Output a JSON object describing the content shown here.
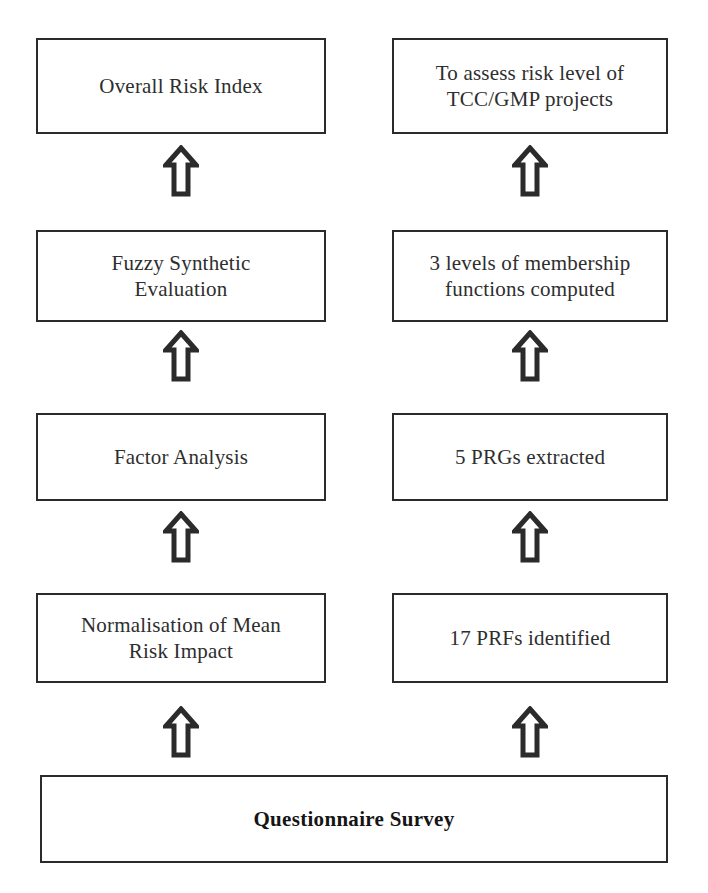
{
  "diagram": {
    "background_color": "#ffffff",
    "line_color": "#2b2b2b",
    "text_color": "#2e2e2e",
    "columns": [
      {
        "name": "process-column",
        "label": "Process steps"
      },
      {
        "name": "outcome-column",
        "label": "Outcomes"
      }
    ],
    "rows": [
      {
        "index": 1,
        "left": "Overall Risk Index",
        "right": "To assess risk level of\nTCC/GMP projects"
      },
      {
        "index": 2,
        "left": "Fuzzy Synthetic\nEvaluation",
        "right": "3 levels of membership\nfunctions computed"
      },
      {
        "index": 3,
        "left": "Factor Analysis",
        "right": "5 PRGs extracted"
      },
      {
        "index": 4,
        "left": "Normalisation of Mean\nRisk Impact",
        "right": "17 PRFs identified"
      }
    ],
    "base": {
      "label": "Questionnaire Survey",
      "emphasis": true
    },
    "arrows": [
      {
        "name": "arrow-left-row4-to-row3",
        "direction": "up",
        "column": "left"
      },
      {
        "name": "arrow-left-row3-to-row2",
        "direction": "up",
        "column": "left"
      },
      {
        "name": "arrow-left-row2-to-row1",
        "direction": "up",
        "column": "left"
      },
      {
        "name": "arrow-left-base-to-row4",
        "direction": "up",
        "column": "left"
      },
      {
        "name": "arrow-right-row4-to-row3",
        "direction": "up",
        "column": "right"
      },
      {
        "name": "arrow-right-row3-to-row2",
        "direction": "up",
        "column": "right"
      },
      {
        "name": "arrow-right-row2-to-row1",
        "direction": "up",
        "column": "right"
      },
      {
        "name": "arrow-right-base-to-row4",
        "direction": "up",
        "column": "right"
      }
    ]
  }
}
